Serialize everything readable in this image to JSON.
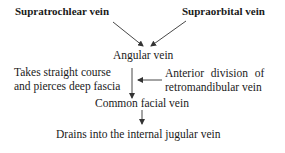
{
  "diagram": {
    "sources": [
      {
        "label": "Supratrochlear vein"
      },
      {
        "label": "Supraorbital vein"
      }
    ],
    "nodes": {
      "angular": "Angular vein",
      "takes_line1": "Takes straight course",
      "takes_line2": "and pierces deep fascia",
      "anterior_line1": "Anterior division of",
      "anterior_line2": "retromandibular vein",
      "common": "Common facial vein",
      "drains": "Drains into the internal jugular vein"
    },
    "colors": {
      "text": "#1a1a1a",
      "arrow": "#333333",
      "background": "#ffffff"
    }
  }
}
